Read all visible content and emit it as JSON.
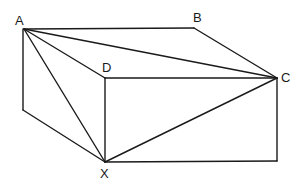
{
  "diagram": {
    "type": "3d-box-geometry",
    "labels": {
      "A": "A",
      "B": "B",
      "C": "C",
      "D": "D",
      "X": "X"
    },
    "vertices": {
      "A": [
        24,
        29
      ],
      "B": [
        194,
        28
      ],
      "C": [
        277,
        78
      ],
      "D": [
        105,
        78
      ],
      "X": [
        105,
        162
      ],
      "P": [
        23,
        110
      ],
      "Q": [
        277,
        161
      ]
    },
    "edges": [
      [
        "A",
        "B"
      ],
      [
        "B",
        "C"
      ],
      [
        "A",
        "D"
      ],
      [
        "A",
        "C"
      ],
      [
        "A",
        "X"
      ],
      [
        "A",
        "P"
      ],
      [
        "P",
        "X"
      ],
      [
        "D",
        "C"
      ],
      [
        "D",
        "X"
      ],
      [
        "X",
        "C"
      ],
      [
        "X",
        "Q"
      ],
      [
        "C",
        "Q"
      ]
    ]
  }
}
